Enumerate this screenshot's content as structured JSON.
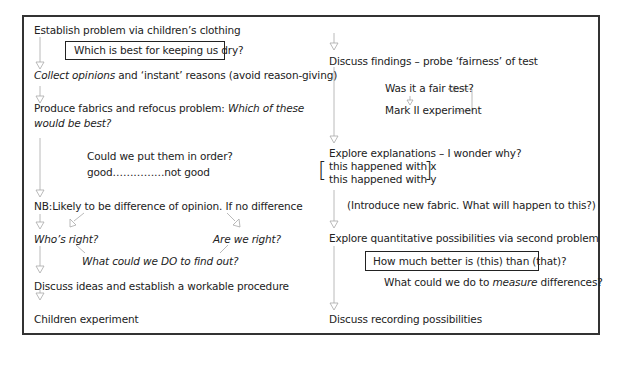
{
  "diagram": {
    "left_column": {
      "step1": "Establish problem via children’s clothing",
      "box1": "Which is best for keeping us dry?",
      "step2_italic": "Collect opinions",
      "step2_rest": " and ‘instant’ reasons (avoid reason-giving)",
      "step3_plain": "Produce fabrics and refocus problem: ",
      "step3_italic": "Which of these",
      "step3_line2": "would be best?",
      "order_q": "Could we put them in order?",
      "order_scale": "good……………not good",
      "step4": "NB:Likely to be difference of opinion. If no difference",
      "whos_right": "Who’s right?",
      "are_we_right": "Are we right?",
      "find_out": "What could we DO to find out?",
      "step5": "Discuss ideas and establish a workable procedure",
      "step6": "Children experiment"
    },
    "right_column": {
      "step1": "Discuss findings – probe ‘fairness’ of test",
      "fair_test": "Was it a fair test?",
      "mark2": "Mark II experiment",
      "step2": "Explore explanations – I wonder why?",
      "happened_x": "this happened with x",
      "happened_y": "this happened with y",
      "new_fabric": "(Introduce new fabric. What will happen to this?)",
      "step3": "Explore quantitative possibilities via second problem",
      "box2": "How much better is (this) than (that)?",
      "measure_pre": "What could we do to ",
      "measure_italic": "measure",
      "measure_post": " differences?",
      "step4": "Discuss recording possibilities"
    },
    "colors": {
      "border": "#333333",
      "arrow": "#999999",
      "text": "#222222"
    }
  }
}
